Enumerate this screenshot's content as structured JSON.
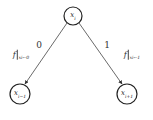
{
  "diagram": {
    "type": "binary-decision-tree",
    "colors": {
      "stroke": "#333333",
      "background": "#ffffff"
    },
    "nodes": [
      {
        "id": "root",
        "var": "x",
        "sub": "i",
        "cx": 73,
        "cy": 16,
        "r": 9
      },
      {
        "id": "left",
        "var": "x",
        "sub": "i−1",
        "cx": 20,
        "cy": 94,
        "r": 10
      },
      {
        "id": "right",
        "var": "x",
        "sub": "i+1",
        "cx": 127,
        "cy": 94,
        "r": 10
      }
    ],
    "edges": [
      {
        "from": "root",
        "to": "left",
        "label": "0",
        "function": {
          "name": "f",
          "restriction": "x",
          "restriction_sub": "i",
          "assign": "←0"
        }
      },
      {
        "from": "root",
        "to": "right",
        "label": "1",
        "function": {
          "name": "f",
          "restriction": "x",
          "restriction_sub": "i",
          "assign": "←1"
        }
      }
    ]
  }
}
